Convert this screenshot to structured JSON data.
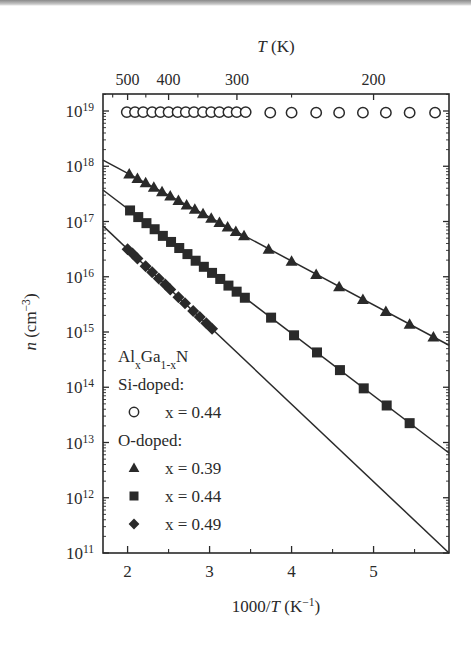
{
  "chart_data": {
    "type": "scatter",
    "title": "",
    "xlabel": "1000/T (K⁻¹)",
    "xlabel_parts": {
      "pre": "1000/",
      "italic": "T",
      "post": " (K",
      "sup": "−1",
      "close": ")"
    },
    "ylabel": "n (cm⁻³)",
    "ylabel_parts": {
      "italic": "n",
      "post": " (cm",
      "sup": "−3",
      "close": ")"
    },
    "top_xlabel": "T (K)",
    "top_xlabel_parts": {
      "italic": "T",
      "post": " (K)"
    },
    "xlim": [
      1.7,
      5.92
    ],
    "ylim_log10": [
      11,
      19.3
    ],
    "yscale": "log",
    "grid": false,
    "x_ticks": [
      2,
      3,
      4,
      5
    ],
    "x_minor_ticks": [
      2.5,
      3.5,
      4.5,
      5.5
    ],
    "y_ticks": [
      {
        "exp": 11,
        "label": "10",
        "sup": "11"
      },
      {
        "exp": 12,
        "label": "10",
        "sup": "12"
      },
      {
        "exp": 13,
        "label": "10",
        "sup": "13"
      },
      {
        "exp": 14,
        "label": "10",
        "sup": "14"
      },
      {
        "exp": 15,
        "label": "10",
        "sup": "15"
      },
      {
        "exp": 16,
        "label": "10",
        "sup": "16"
      },
      {
        "exp": 17,
        "label": "10",
        "sup": "17"
      },
      {
        "exp": 18,
        "label": "10",
        "sup": "18"
      },
      {
        "exp": 19,
        "label": "10",
        "sup": "19"
      }
    ],
    "top_ticks": [
      {
        "T": 500,
        "label": "500"
      },
      {
        "T": 400,
        "label": "400"
      },
      {
        "T": 300,
        "label": "300"
      },
      {
        "T": 200,
        "label": "200"
      }
    ],
    "top_minor_ticks_T": [
      550,
      450,
      350,
      250
    ],
    "legend": {
      "title": "AlxGa1-xN",
      "title_parts": {
        "a": "Al",
        "sub1": "x",
        "b": "Ga",
        "sub2": "1-x",
        "c": "N"
      },
      "groups": [
        {
          "heading": "Si-doped:",
          "entries": [
            {
              "marker": "circle-open",
              "label": "x = 0.44"
            }
          ]
        },
        {
          "heading": "O-doped:",
          "entries": [
            {
              "marker": "triangle",
              "label": "x = 0.39"
            },
            {
              "marker": "square",
              "label": "x = 0.44"
            },
            {
              "marker": "diamond",
              "label": "x = 0.49"
            }
          ]
        }
      ],
      "position": "lower left"
    },
    "series": [
      {
        "name": "Si-doped x = 0.44",
        "marker": "circle-open",
        "x": [
          1.99,
          2.09,
          2.19,
          2.3,
          2.4,
          2.5,
          2.61,
          2.71,
          2.81,
          2.92,
          3.02,
          3.12,
          3.23,
          3.33,
          3.44,
          3.74,
          4.0,
          4.3,
          4.58,
          4.87,
          5.15,
          5.44,
          5.75
        ],
        "log10_n": [
          18.98,
          18.98,
          18.98,
          18.98,
          18.98,
          18.98,
          18.98,
          18.98,
          18.98,
          18.98,
          18.98,
          18.98,
          18.98,
          18.98,
          18.98,
          18.97,
          18.97,
          18.97,
          18.97,
          18.97,
          18.97,
          18.97,
          18.97
        ]
      },
      {
        "name": "O-doped x = 0.39",
        "marker": "triangle",
        "fit_line": {
          "x": [
            1.7,
            5.92
          ],
          "log10_n": [
            18.11,
            14.76
          ]
        },
        "x": [
          2.02,
          2.12,
          2.22,
          2.32,
          2.42,
          2.52,
          2.62,
          2.72,
          2.82,
          2.92,
          3.02,
          3.12,
          3.22,
          3.32,
          3.42,
          3.72,
          4.0,
          4.3,
          4.58,
          4.87,
          5.15,
          5.44,
          5.73
        ],
        "log10_n": [
          17.86,
          17.78,
          17.7,
          17.62,
          17.54,
          17.46,
          17.38,
          17.3,
          17.22,
          17.14,
          17.06,
          16.98,
          16.9,
          16.82,
          16.74,
          16.5,
          16.28,
          16.04,
          15.82,
          15.59,
          15.37,
          15.14,
          14.91
        ]
      },
      {
        "name": "O-doped x = 0.44",
        "marker": "square",
        "fit_line": {
          "x": [
            1.7,
            5.92
          ],
          "log10_n": [
            17.57,
            12.81
          ]
        },
        "x": [
          2.03,
          2.13,
          2.23,
          2.33,
          2.43,
          2.53,
          2.63,
          2.73,
          2.83,
          2.93,
          3.03,
          3.13,
          3.23,
          3.33,
          3.43,
          3.75,
          4.03,
          4.31,
          4.59,
          4.88,
          5.16,
          5.44
        ],
        "log10_n": [
          17.2,
          17.08,
          16.97,
          16.86,
          16.74,
          16.63,
          16.52,
          16.41,
          16.29,
          16.18,
          16.07,
          15.96,
          15.84,
          15.73,
          15.62,
          15.26,
          14.94,
          14.63,
          14.31,
          13.98,
          13.67,
          13.35
        ]
      },
      {
        "name": "O-doped x = 0.49",
        "marker": "diamond",
        "fit_line": {
          "x": [
            1.7,
            5.92
          ],
          "log10_n": [
            16.92,
            11.0
          ]
        },
        "x": [
          2.0,
          2.06,
          2.12,
          2.22,
          2.3,
          2.38,
          2.46,
          2.52,
          2.62,
          2.7,
          2.8,
          2.88,
          2.96,
          3.03
        ],
        "log10_n": [
          16.5,
          16.42,
          16.33,
          16.19,
          16.08,
          15.97,
          15.86,
          15.77,
          15.63,
          15.52,
          15.38,
          15.27,
          15.16,
          15.06
        ]
      }
    ]
  }
}
